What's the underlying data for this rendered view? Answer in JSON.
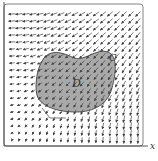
{
  "figure": {
    "type": "vector-field-diagram",
    "region_label": "D",
    "curve_label": "C",
    "x_axis_label": "x",
    "colors": {
      "background": "#ffffff",
      "frame": "#555555",
      "region_fill": "#a9a9a9",
      "region_stroke": "#444444",
      "arrows": "#444444",
      "text": "#333333"
    }
  }
}
